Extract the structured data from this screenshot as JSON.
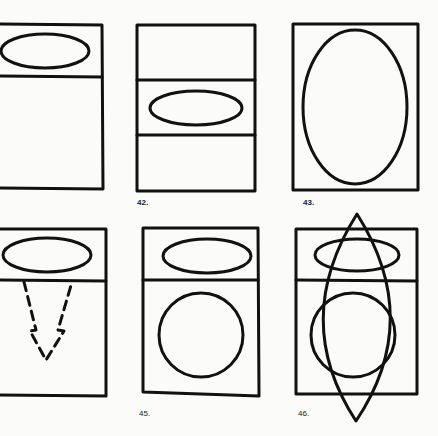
{
  "figures": [
    {
      "id": "41",
      "label": ""
    },
    {
      "id": "42",
      "label": "42."
    },
    {
      "id": "43",
      "label": "43."
    },
    {
      "id": "44",
      "label": ""
    },
    {
      "id": "45",
      "label": "45."
    },
    {
      "id": "46",
      "label": "46."
    }
  ],
  "colors": {
    "ink": "#111111",
    "paper": "#fbfbf9"
  }
}
